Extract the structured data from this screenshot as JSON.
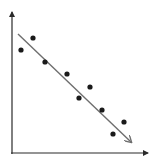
{
  "chart_data": {
    "type": "scatter",
    "title": "",
    "xlabel": "",
    "ylabel": "",
    "grid": false,
    "legend": null,
    "points": [
      {
        "x": 21,
        "y": 50
      },
      {
        "x": 33,
        "y": 38
      },
      {
        "x": 45,
        "y": 62
      },
      {
        "x": 67,
        "y": 74
      },
      {
        "x": 79,
        "y": 98
      },
      {
        "x": 90,
        "y": 87
      },
      {
        "x": 102,
        "y": 110
      },
      {
        "x": 113,
        "y": 134
      },
      {
        "x": 124,
        "y": 122
      }
    ],
    "trend_line": {
      "x1": 18,
      "y1": 34,
      "x2": 131,
      "y2": 142,
      "arrow": true
    },
    "axes": {
      "origin": {
        "x": 12,
        "y": 153
      },
      "y_top": 12,
      "x_right": 148
    }
  },
  "colors": {
    "axis": "#2a2a2a",
    "point": "#1a1a1a",
    "trend": "#6e6e6e"
  }
}
